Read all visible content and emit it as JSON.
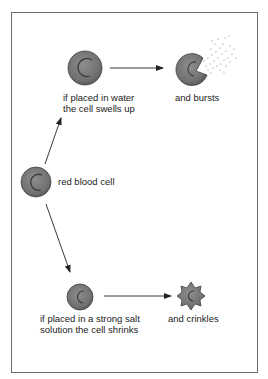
{
  "diagram": {
    "colors": {
      "cell_fill": "#7a7a7a",
      "cell_edge": "#444444",
      "arrow": "#222222",
      "frame": "#6a6a6a"
    },
    "nodes": [
      {
        "id": "rbc",
        "label": "red blood cell"
      },
      {
        "id": "swollen",
        "label_line1": "if placed in water",
        "label_line2": "the cell swells up"
      },
      {
        "id": "burst",
        "label": "and bursts"
      },
      {
        "id": "shrunk",
        "label_line1": "if placed in a strong salt",
        "label_line2": "solution the cell shrinks"
      },
      {
        "id": "crinkled",
        "label": "and crinkles"
      }
    ],
    "edges": [
      {
        "from": "rbc",
        "to": "swollen"
      },
      {
        "from": "swollen",
        "to": "burst"
      },
      {
        "from": "rbc",
        "to": "shrunk"
      },
      {
        "from": "shrunk",
        "to": "crinkled"
      }
    ]
  }
}
